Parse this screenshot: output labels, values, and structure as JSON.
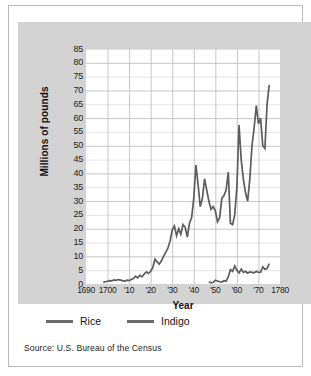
{
  "chart_data": {
    "type": "line",
    "title": "",
    "xlabel": "Year",
    "ylabel": "Millions of pounds",
    "xlim": [
      1690,
      1780
    ],
    "ylim": [
      0,
      85
    ],
    "grid": true,
    "legend_position": "bottom-left",
    "y_ticks": [
      85,
      80,
      75,
      70,
      65,
      60,
      55,
      50,
      45,
      40,
      35,
      30,
      25,
      20,
      15,
      10,
      5,
      0
    ],
    "x_ticks": [
      {
        "value": 1690,
        "label": "1690"
      },
      {
        "value": 1700,
        "label": "1700"
      },
      {
        "value": 1710,
        "label": "'10"
      },
      {
        "value": 1720,
        "label": "'20"
      },
      {
        "value": 1730,
        "label": "'30"
      },
      {
        "value": 1740,
        "label": "'40"
      },
      {
        "value": 1750,
        "label": "'50"
      },
      {
        "value": 1760,
        "label": "'60"
      },
      {
        "value": 1770,
        "label": "'70"
      },
      {
        "value": 1780,
        "label": "1780"
      }
    ],
    "series": [
      {
        "name": "Rice",
        "color": "#5c5c5c",
        "x": [
          1698,
          1699,
          1700,
          1701,
          1702,
          1703,
          1704,
          1705,
          1706,
          1707,
          1708,
          1709,
          1710,
          1711,
          1712,
          1713,
          1714,
          1715,
          1716,
          1717,
          1718,
          1719,
          1720,
          1721,
          1722,
          1723,
          1724,
          1725,
          1726,
          1727,
          1728,
          1729,
          1730,
          1731,
          1732,
          1733,
          1734,
          1735,
          1736,
          1737,
          1738,
          1739,
          1740,
          1741,
          1742,
          1743,
          1744,
          1745,
          1746,
          1747,
          1748,
          1749,
          1750,
          1751,
          1752,
          1753,
          1754,
          1755,
          1756,
          1757,
          1758,
          1759,
          1760,
          1761,
          1762,
          1763,
          1764,
          1765,
          1766,
          1767,
          1768,
          1769,
          1770,
          1771,
          1772,
          1773,
          1774,
          1775
        ],
        "values": [
          0.6,
          0.8,
          1.0,
          1.2,
          1.1,
          1.5,
          1.3,
          1.6,
          1.4,
          1.2,
          1.0,
          1.4,
          1.2,
          1.6,
          2.0,
          2.8,
          2.2,
          3.2,
          2.6,
          3.6,
          4.4,
          3.8,
          4.6,
          6.0,
          9.0,
          8.0,
          7.2,
          8.4,
          10.0,
          11.5,
          13.0,
          15.5,
          19.5,
          21.0,
          17.5,
          20.0,
          18.0,
          21.5,
          20.5,
          17.0,
          22.0,
          24.0,
          31.0,
          43.0,
          36.0,
          28.0,
          31.0,
          38.0,
          34.0,
          30.0,
          27.0,
          28.0,
          26.5,
          22.5,
          24.0,
          31.0,
          32.0,
          34.0,
          40.5,
          22.0,
          21.5,
          25.0,
          35.0,
          57.5,
          45.0,
          38.0,
          33.0,
          30.0,
          38.0,
          50.0,
          56.5,
          64.5,
          58.0,
          60.0,
          50.0,
          49.0,
          65.0,
          72.0
        ]
      },
      {
        "name": "Indigo",
        "color": "#5c5c5c",
        "x": [
          1747,
          1748,
          1749,
          1750,
          1751,
          1752,
          1753,
          1754,
          1755,
          1756,
          1757,
          1758,
          1759,
          1760,
          1761,
          1762,
          1763,
          1764,
          1765,
          1766,
          1767,
          1768,
          1769,
          1770,
          1771,
          1772,
          1773,
          1774,
          1775
        ],
        "values": [
          0.8,
          0.4,
          0.6,
          1.4,
          1.1,
          0.8,
          0.7,
          1.2,
          1.0,
          2.6,
          5.2,
          4.6,
          6.5,
          5.0,
          4.0,
          5.4,
          4.2,
          4.6,
          3.9,
          4.4,
          4.2,
          4.0,
          4.6,
          4.2,
          4.3,
          6.2,
          5.3,
          5.6,
          7.4
        ]
      }
    ],
    "rice_peak_note": "peak 85 near 1770",
    "legend": [
      {
        "label": "Rice"
      },
      {
        "label": "Indigo"
      }
    ]
  },
  "legend": {
    "items": [
      {
        "label": "Rice"
      },
      {
        "label": "Indigo"
      }
    ]
  },
  "axes": {
    "y_title": "Millions of pounds",
    "x_title": "Year"
  },
  "source": {
    "text": "Source: U.S. Bureau of the Census"
  }
}
